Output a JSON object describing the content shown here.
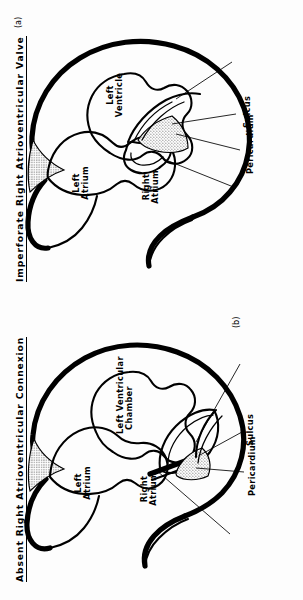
{
  "figure": {
    "orientation": "rotated-90-ccw",
    "panels": [
      {
        "id": "(b)",
        "title": "Absent Right Atrioventricular Connexion",
        "chamber_labels": [
          "Left\nAtrium",
          "Right\nAtrium",
          "Left Ventricular\nChamber"
        ],
        "chamber_label_left_atrium_line1": "Left",
        "chamber_label_left_atrium_line2": "Atrium",
        "chamber_label_right_atrium_line1": "Right",
        "chamber_label_right_atrium_line2": "Atrium",
        "chamber_label_lv_line1": "Left Ventricular",
        "chamber_label_lv_line2": "Chamber",
        "callouts": [
          "Dimple",
          "Pericardium",
          "Sulcus",
          "Central Fibrous\nBody"
        ],
        "callout_dimple": "Dimple",
        "callout_pericardium": "Pericardium",
        "callout_sulcus": "Sulcus",
        "callout_cfb_line1": "Central Fibrous",
        "callout_cfb_line2": "Body"
      },
      {
        "id": "(a)",
        "title": "Imperforate Right Atrioventricular Valve",
        "chamber_labels": [
          "Left\nAtrium",
          "Right\nAtrium",
          "Left\nVentricle"
        ],
        "chamber_label_left_atrium_line1": "Left",
        "chamber_label_left_atrium_line2": "Atrium",
        "chamber_label_right_atrium_line1": "Right",
        "chamber_label_right_atrium_line2": "Atrium",
        "chamber_label_lv_line1": "Left",
        "chamber_label_lv_line2": "Ventricle",
        "callouts": [
          "Imperforate\nValve Membrane",
          "Pericardium",
          "Sulcus",
          "Hypoplastic Right\nVentricle"
        ],
        "callout_membrane_line1": "Imperforate",
        "callout_membrane_line2": "Valve Membrane",
        "callout_pericardium": "Pericardium",
        "callout_sulcus": "Sulcus",
        "callout_hrv_line1": "Hypoplastic Right",
        "callout_hrv_line2": "Ventricle"
      }
    ]
  },
  "colors": {
    "ink": "#000000",
    "paper": "#fdfdfd",
    "stipple": "#9a9a9a",
    "stipple_light": "#c9c9c9"
  }
}
